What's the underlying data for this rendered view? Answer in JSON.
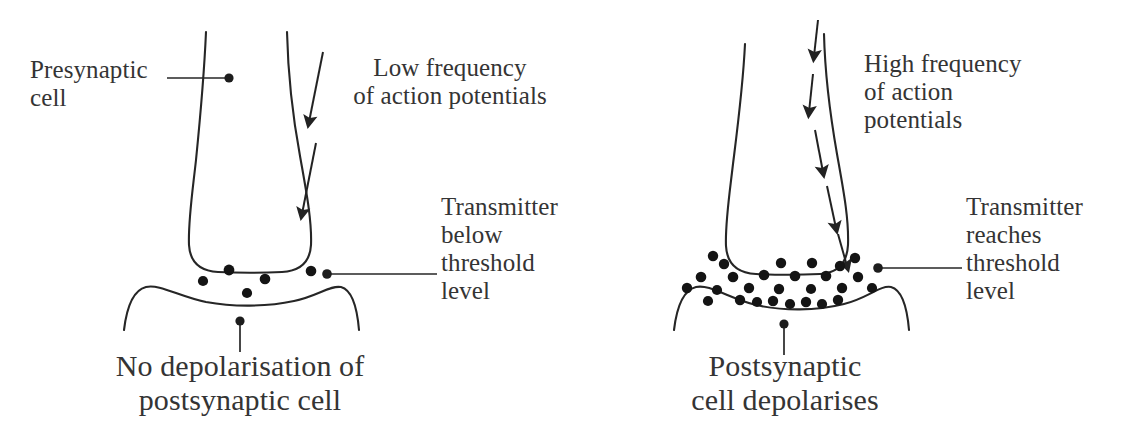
{
  "figure": {
    "background_color": "#ffffff",
    "ink_color": "#2b2b2b",
    "text_color": "#343434"
  },
  "panels": [
    {
      "id": "low-frequency",
      "side": "left",
      "labels": {
        "presynaptic": "Presynaptic\ncell",
        "frequency": "Low frequency\nof action potentials",
        "transmitter": "Transmitter\nbelow\nthreshold\nlevel",
        "outcome": "No depolarisation of\npostsynaptic cell"
      },
      "arrow_count": 2,
      "vesicle_count": 5
    },
    {
      "id": "high-frequency",
      "side": "right",
      "labels": {
        "frequency": "High frequency\nof action\npotentials",
        "transmitter": "Transmitter\nreaches\nthreshold\nlevel",
        "outcome": "Postsynaptic\ncell depolarises"
      },
      "arrow_count": 5,
      "vesicle_count": 27
    }
  ],
  "icons": {
    "arrow": "downward-arrow-icon",
    "vesicle": "transmitter-dot-icon",
    "leader": "leader-line-icon"
  },
  "geometry": {
    "left_vesicles": [
      [
        203,
        280
      ],
      [
        228,
        270
      ],
      [
        245,
        292
      ],
      [
        264,
        279
      ],
      [
        310,
        271
      ]
    ],
    "right_vesicles": [
      [
        713,
        256
      ],
      [
        700,
        276
      ],
      [
        741,
        266
      ],
      [
        726,
        288
      ],
      [
        757,
        281
      ],
      [
        772,
        262
      ],
      [
        789,
        276
      ],
      [
        805,
        288
      ],
      [
        820,
        268
      ],
      [
        836,
        281
      ],
      [
        851,
        265
      ],
      [
        866,
        279
      ],
      [
        748,
        297
      ],
      [
        764,
        303
      ],
      [
        781,
        296
      ],
      [
        797,
        303
      ],
      [
        813,
        297
      ],
      [
        829,
        304
      ],
      [
        845,
        295
      ],
      [
        688,
        290
      ],
      [
        703,
        300
      ],
      [
        718,
        283
      ],
      [
        733,
        278
      ],
      [
        862,
        293
      ],
      [
        776,
        284
      ],
      [
        808,
        277
      ],
      [
        792,
        293
      ]
    ],
    "left_arrows": [
      [
        322,
        55,
        310,
        125
      ],
      [
        315,
        145,
        303,
        218
      ]
    ],
    "right_arrows": [
      [
        818,
        22,
        812,
        62
      ],
      [
        812,
        78,
        806,
        118
      ],
      [
        814,
        132,
        820,
        180
      ],
      [
        824,
        190,
        832,
        232
      ],
      [
        835,
        238,
        843,
        268
      ]
    ]
  }
}
